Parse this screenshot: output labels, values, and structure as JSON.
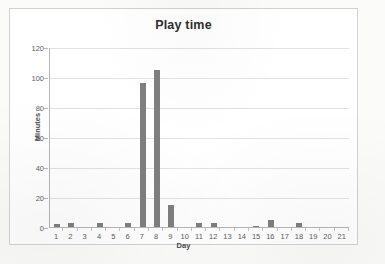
{
  "chart_data": {
    "type": "bar",
    "title": "Play time",
    "xlabel": "Day",
    "ylabel": "Minutes",
    "categories": [
      "1",
      "2",
      "3",
      "4",
      "5",
      "6",
      "7",
      "8",
      "9",
      "10",
      "11",
      "12",
      "13",
      "14",
      "15",
      "16",
      "17",
      "18",
      "19",
      "20",
      "21"
    ],
    "values": [
      2,
      2.5,
      0,
      2.5,
      0,
      2.5,
      96,
      105,
      15,
      0,
      3,
      2.5,
      0,
      0,
      0.5,
      5,
      0,
      2.5,
      0,
      0,
      0
    ],
    "ylim": [
      0,
      120
    ],
    "yticks": [
      0,
      20,
      40,
      60,
      80,
      100,
      120
    ],
    "ytick_labels": [
      "0",
      "20",
      "40",
      "60",
      "80",
      "100",
      "120"
    ],
    "grid": true,
    "legend": false,
    "bar_color": "#7f7f7f",
    "gridline_color": "#e2e2e2",
    "axis_color": "#b6b6b6",
    "plot_background": "#ffffff",
    "frame_border_color": "#d2d2d2"
  }
}
